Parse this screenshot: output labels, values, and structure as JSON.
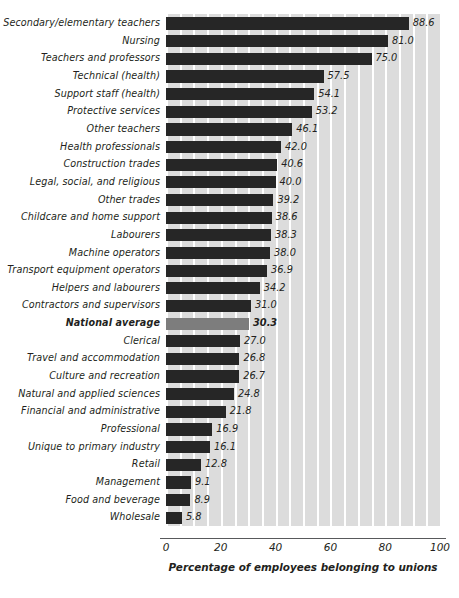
{
  "chart_data": {
    "type": "bar",
    "orientation": "horizontal",
    "title": "",
    "xlabel": "Percentage of employees belonging to unions",
    "ylabel": "",
    "xlim": [
      0,
      100
    ],
    "xticks": [
      0,
      20,
      40,
      60,
      80,
      100
    ],
    "grid": true,
    "grid_interval": 5,
    "grid_axis": "x",
    "legend": "none",
    "bar_color": "#262626",
    "highlight_color": "#7d7d7d",
    "plot_background": "#dcdcdc",
    "highlight_category": "National average",
    "categories": [
      "Secondary/elementary teachers",
      "Nursing",
      "Teachers and professors",
      "Technical (health)",
      "Support staff (health)",
      "Protective services",
      "Other teachers",
      "Health professionals",
      "Construction trades",
      "Legal, social, and religious",
      "Other trades",
      "Childcare and home support",
      "Labourers",
      "Machine operators",
      "Transport equipment operators",
      "Helpers and labourers",
      "Contractors and supervisors",
      "National average",
      "Clerical",
      "Travel and accommodation",
      "Culture and recreation",
      "Natural and applied sciences",
      "Financial and administrative",
      "Professional",
      "Unique to primary industry",
      "Retail",
      "Management",
      "Food and beverage",
      "Wholesale"
    ],
    "values": [
      88.6,
      81.0,
      75.0,
      57.5,
      54.1,
      53.2,
      46.1,
      42.0,
      40.6,
      40.0,
      39.2,
      38.6,
      38.3,
      38.0,
      36.9,
      34.2,
      31.0,
      30.3,
      27.0,
      26.8,
      26.7,
      24.8,
      21.8,
      16.9,
      16.1,
      12.8,
      9.1,
      8.9,
      5.8
    ],
    "value_labels": [
      "88.6",
      "81.0",
      "75.0",
      "57.5",
      "54.1",
      "53.2",
      "46.1",
      "42.0",
      "40.6",
      "40.0",
      "39.2",
      "38.6",
      "38.3",
      "38.0",
      "36.9",
      "34.2",
      "31.0",
      "30.3",
      "27.0",
      "26.8",
      "26.7",
      "24.8",
      "21.8",
      "16.9",
      "16.1",
      "12.8",
      "9.1",
      "8.9",
      "5.8"
    ]
  }
}
